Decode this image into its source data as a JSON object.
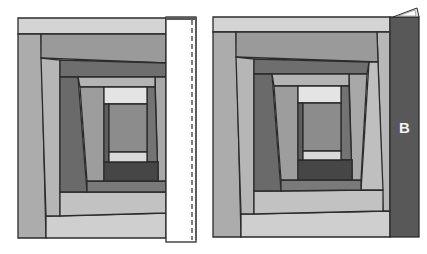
{
  "figure": {
    "colors": {
      "outline": "#2b2b2b",
      "lightest": "#d6d6d6",
      "light": "#bdbdbd",
      "mid_light": "#a9a9a9",
      "mid": "#8f8f8f",
      "mid_dark": "#747474",
      "dark": "#5c5c5c",
      "darkest": "#3f3f3f",
      "strip_white": "#ffffff",
      "strip_b": "#585858"
    },
    "left_panel": {
      "pieces": [
        {
          "name": "outer-top",
          "fill": "#d4d4d4",
          "points": "18,18 166,18 166,34 18,34"
        },
        {
          "name": "outer-left",
          "fill": "#acacac",
          "points": "18,34 41,34 46,238 18,238"
        },
        {
          "name": "outer-bottom",
          "fill": "#cfcfcf",
          "points": "46,216 166,213 166,238 46,238"
        },
        {
          "name": "ring2-top",
          "fill": "#9a9a9a",
          "points": "41,34 166,34 166,63 41,58"
        },
        {
          "name": "ring2-left",
          "fill": "#b6b6b6",
          "points": "41,58 60,60 60,216 46,216"
        },
        {
          "name": "ring2-bottom",
          "fill": "#c2c2c2",
          "points": "60,192 166,192 166,213 60,216"
        },
        {
          "name": "ring3-top",
          "fill": "#6e6e6e",
          "points": "60,60 166,63 166,77 60,77"
        },
        {
          "name": "ring3-left",
          "fill": "#6a6a6a",
          "points": "60,77 78,77 87,192 60,192"
        },
        {
          "name": "ring3-bottom",
          "fill": "#7a7a7a",
          "points": "87,181 166,181 166,192 87,192"
        },
        {
          "name": "ring3-right",
          "fill": "#a8a8a8",
          "points": "155,77 166,77 166,181 158,181"
        },
        {
          "name": "ring4-top",
          "fill": "#b4b4b4",
          "points": "78,77 155,77 155,87 80,87"
        },
        {
          "name": "ring4-left",
          "fill": "#9d9d9d",
          "points": "80,87 104,87 104,181 87,181"
        },
        {
          "name": "ring4-right",
          "fill": "#737373",
          "points": "147,87 155,87 158,181 158,162 147,162"
        },
        {
          "name": "ring4-bottom",
          "fill": "#464646",
          "points": "104,162 158,162 158,181 104,181"
        },
        {
          "name": "center-top",
          "fill": "#e4e4e4",
          "points": "104,87 147,87 147,104 104,104"
        },
        {
          "name": "center-left",
          "fill": "#5e5e5e",
          "points": "104,104 109,104 109,162 104,162"
        },
        {
          "name": "center-square",
          "fill": "#8c8c8c",
          "points": "109,104 147,104 147,152 109,152"
        },
        {
          "name": "center-bottom",
          "fill": "#d9d9d9",
          "points": "109,152 147,152 147,162 109,162"
        }
      ],
      "strip": {
        "name": "new-strip-face-down",
        "x": 166,
        "y": 17,
        "width": 30,
        "height": 225,
        "fill": "#ffffff",
        "top_edge_fill": "#5a5a5a"
      },
      "stitch_line": {
        "x": 192,
        "y1": 20,
        "y2": 240,
        "dash": "5,3"
      }
    },
    "right_panel": {
      "pieces": [
        {
          "name": "outer-top",
          "fill": "#d4d4d4",
          "points": "213,17 390,17 390,32 213,32"
        },
        {
          "name": "outer-left",
          "fill": "#acacac",
          "points": "213,32 236,32 241,237 213,237"
        },
        {
          "name": "outer-bottom",
          "fill": "#cfcfcf",
          "points": "241,214 390,211 390,237 241,237"
        },
        {
          "name": "outer-right",
          "fill": "#b8b8b8",
          "points": "377,32 390,32 390,211 383,211"
        },
        {
          "name": "ring2-top",
          "fill": "#9a9a9a",
          "points": "236,32 377,32 378,62 236,57"
        },
        {
          "name": "ring2-left",
          "fill": "#b6b6b6",
          "points": "236,57 254,59 254,214 241,214"
        },
        {
          "name": "ring2-bottom",
          "fill": "#c2c2c2",
          "points": "254,191 383,190 383,211 254,214"
        },
        {
          "name": "ring2-right",
          "fill": "#bfbfbf",
          "points": "369,62 378,62 383,190 361,190"
        },
        {
          "name": "ring3-top",
          "fill": "#6e6e6e",
          "points": "254,59 369,62 367,74 254,74"
        },
        {
          "name": "ring3-left",
          "fill": "#6a6a6a",
          "points": "254,74 272,74 281,191 254,191"
        },
        {
          "name": "ring3-bottom",
          "fill": "#7a7a7a",
          "points": "281,180 361,180 361,190 281,191"
        },
        {
          "name": "ring3-right",
          "fill": "#a8a8a8",
          "points": "349,74 367,74 361,180 352,180"
        },
        {
          "name": "ring4-top",
          "fill": "#b4b4b4",
          "points": "272,74 349,74 349,86 274,86"
        },
        {
          "name": "ring4-left",
          "fill": "#9d9d9d",
          "points": "274,86 298,86 298,180 281,180"
        },
        {
          "name": "ring4-right",
          "fill": "#737373",
          "points": "341,86 349,86 352,180 352,160 341,160"
        },
        {
          "name": "ring4-bottom",
          "fill": "#464646",
          "points": "298,160 352,160 352,180 298,180"
        },
        {
          "name": "center-top",
          "fill": "#e4e4e4",
          "points": "298,86 341,86 341,103 298,103"
        },
        {
          "name": "center-left",
          "fill": "#5e5e5e",
          "points": "298,103 303,103 303,160 298,160"
        },
        {
          "name": "center-square",
          "fill": "#8c8c8c",
          "points": "303,103 341,103 341,151 303,151"
        },
        {
          "name": "center-bottom",
          "fill": "#d9d9d9",
          "points": "303,151 341,151 341,160 303,160"
        }
      ],
      "strip_b": {
        "name": "strip-b-pressed-open",
        "x": 390,
        "y": 17,
        "width": 29,
        "height": 220,
        "fill": "#585858"
      },
      "fold_tab": {
        "points": "393,17 417,8 419,17",
        "fill": "#e8e8e8"
      },
      "fold_tab_inner": {
        "points": "398,16 415,10 416,16",
        "fill": "#ffffff"
      },
      "label": {
        "text": "B",
        "x": 399,
        "y": 120
      }
    }
  }
}
